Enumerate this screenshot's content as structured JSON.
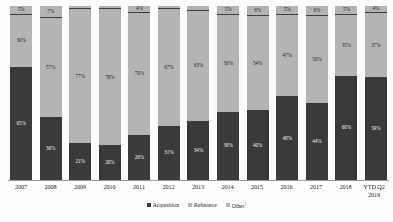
{
  "chart_data": {
    "type": "bar",
    "variant": "100% stacked column",
    "title": "",
    "subtitle": "",
    "xlabel": "",
    "ylabel": "",
    "ylim": [
      0,
      100
    ],
    "grid": false,
    "legend_position": "bottom-center",
    "categories": [
      "2007",
      "2008",
      "2009",
      "2010",
      "2011",
      "2012",
      "2013",
      "2014",
      "2015",
      "2016",
      "2017",
      "2018",
      "YTD Q2 2019"
    ],
    "series": [
      {
        "name": "Acquisition",
        "color": "#3a3a3a",
        "values": [
          65,
          36,
          21,
          20,
          26,
          31,
          34,
          39,
          40,
          48,
          44,
          60,
          59
        ],
        "labels": [
          "65%",
          "36%",
          "21%",
          "20%",
          "26%",
          "31%",
          "34%",
          "39%",
          "40%",
          "48%",
          "44%",
          "60%",
          "59%"
        ]
      },
      {
        "name": "Refinance",
        "color": "#b4b4b4",
        "values": [
          30,
          57,
          77,
          78,
          70,
          67,
          63,
          56,
          54,
          47,
          50,
          35,
          37
        ],
        "labels": [
          "30%",
          "57%",
          "77%",
          "78%",
          "70%",
          "67%",
          "63%",
          "56%",
          "54%",
          "47%",
          "50%",
          "35%",
          "37%"
        ]
      },
      {
        "name": "Other",
        "color": "#b4b4b4",
        "values": [
          5,
          7,
          2,
          2,
          4,
          2,
          3,
          5,
          6,
          5,
          6,
          5,
          4
        ],
        "labels": [
          "5%",
          "7%",
          "2%",
          "2%",
          "4%",
          "2%",
          "3%",
          "5%",
          "6%",
          "5%",
          "6%",
          "5%",
          "4%"
        ]
      }
    ]
  },
  "legend": {
    "items": [
      {
        "label": "Acquisition",
        "superscript": ""
      },
      {
        "label": "Refinance",
        "superscript": ""
      },
      {
        "label": "Other",
        "superscript": "1"
      }
    ]
  },
  "axis": {
    "category_labels": [
      {
        "line1": "2007",
        "line2": ""
      },
      {
        "line1": "2008",
        "line2": ""
      },
      {
        "line1": "2009",
        "line2": ""
      },
      {
        "line1": "2010",
        "line2": ""
      },
      {
        "line1": "2011",
        "line2": ""
      },
      {
        "line1": "2012",
        "line2": ""
      },
      {
        "line1": "2013",
        "line2": ""
      },
      {
        "line1": "2014",
        "line2": ""
      },
      {
        "line1": "2015",
        "line2": ""
      },
      {
        "line1": "2016",
        "line2": ""
      },
      {
        "line1": "2017",
        "line2": ""
      },
      {
        "line1": "2018",
        "line2": ""
      },
      {
        "line1": "YTD Q2",
        "line2": "2019"
      }
    ]
  },
  "colors": {
    "acquisition": "#3a3a3a",
    "refinance": "#b4b4b4",
    "other": "#b4b4b4",
    "axis": "#9a9a9a",
    "background": "#fdfdfd"
  }
}
